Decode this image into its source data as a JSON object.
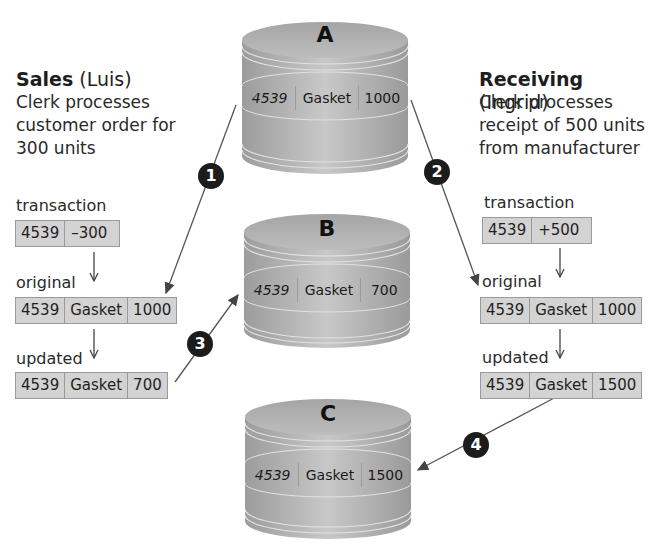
{
  "left_panel": {
    "title": "Sales",
    "actor": "(Luis)",
    "description": [
      "Clerk processes",
      "customer order for",
      "300 units"
    ],
    "transaction_label": "transaction",
    "transaction": [
      "4539",
      "–300"
    ],
    "original_label": "original",
    "original": [
      "4539",
      "Gasket",
      "1000"
    ],
    "updated_label": "updated",
    "updated": [
      "4539",
      "Gasket",
      "700"
    ]
  },
  "right_panel": {
    "title": "Receiving",
    "actor": "(Ingrid)",
    "description": [
      "Clerk processes",
      "receipt of 500 units",
      "from manufacturer"
    ],
    "transaction_label": "transaction",
    "transaction": [
      "4539",
      "+500"
    ],
    "original_label": "original",
    "original": [
      "4539",
      "Gasket",
      "1000"
    ],
    "updated_label": "updated",
    "updated": [
      "4539",
      "Gasket",
      "1500"
    ]
  },
  "databases": [
    {
      "letter": "A",
      "record": [
        "4539",
        "Gasket",
        "1000"
      ]
    },
    {
      "letter": "B",
      "record": [
        "4539",
        "Gasket",
        "700"
      ]
    },
    {
      "letter": "C",
      "record": [
        "4539",
        "Gasket",
        "1500"
      ]
    }
  ],
  "steps": [
    "1",
    "2",
    "3",
    "4"
  ],
  "colors": {
    "cell_fill": "#d3d3d3",
    "cell_border": "#9a9a9a",
    "badge": "#1c1c1c",
    "cylinder": "#b5b5b5"
  }
}
